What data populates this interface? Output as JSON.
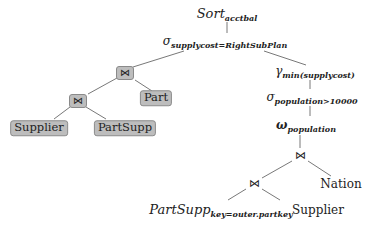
{
  "diagram": {
    "type": "query-plan-tree",
    "nodes": {
      "sort": {
        "base": "Sort",
        "sub": "acctbal"
      },
      "select_supplycost": {
        "base": "σ",
        "sub": "supplycost=RightSubPlan"
      },
      "join_top_left": {
        "symbol": "⋈",
        "highlighted": true
      },
      "join_lower_left": {
        "symbol": "⋈",
        "highlighted": true
      },
      "supplier_left": {
        "label": "Supplier",
        "highlighted": true
      },
      "partsupp_left": {
        "label": "PartSupp",
        "highlighted": true
      },
      "part": {
        "label": "Part",
        "highlighted": true
      },
      "gamma": {
        "base": "γ",
        "sub": "min(supplycost)"
      },
      "select_population": {
        "base": "σ",
        "sub": "population>10000"
      },
      "omega": {
        "base": "ω",
        "sub": "population"
      },
      "join_right_top": {
        "symbol": "⋈"
      },
      "nation": {
        "label": "Nation"
      },
      "join_right_lower": {
        "symbol": "⋈"
      },
      "partsupp_right": {
        "base": "PartSupp",
        "sub": "key=outer.partkey"
      },
      "supplier_right": {
        "label": "Supplier"
      }
    },
    "colors": {
      "highlight_fill": "#bdbdbd",
      "highlight_border": "#8a8a8a",
      "edge": "#444444"
    }
  }
}
